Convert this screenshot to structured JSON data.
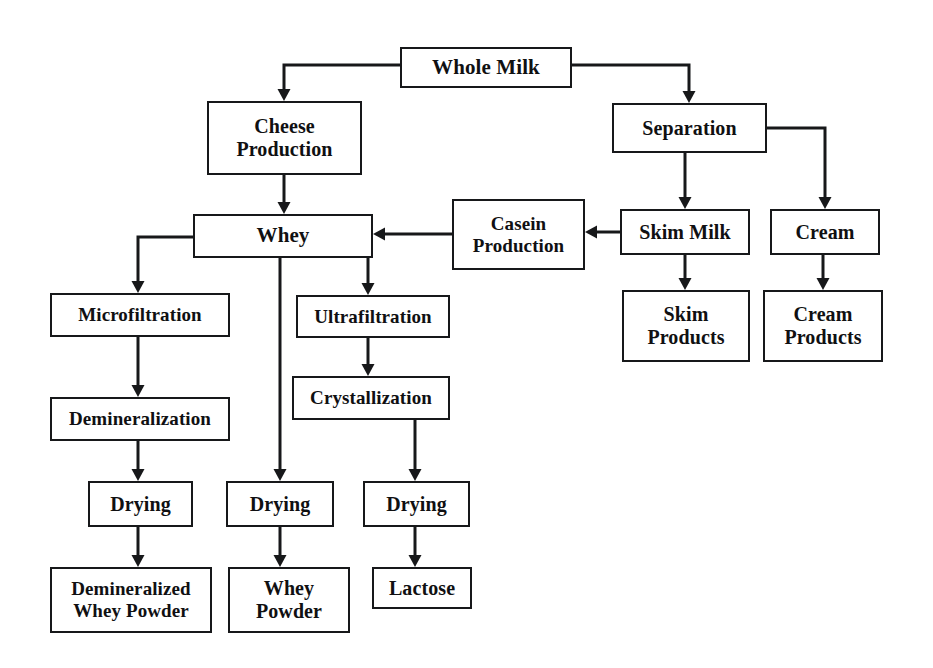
{
  "diagram": {
    "background_color": "#ffffff",
    "line_color": "#17181a",
    "text_color": "#101012",
    "nodes": [
      {
        "id": "whole_milk",
        "label": "Whole Milk",
        "x": 400,
        "y": 47,
        "w": 172,
        "h": 41,
        "font_size": 21
      },
      {
        "id": "cheese_production",
        "label": "Cheese\nProduction",
        "x": 207,
        "y": 101,
        "w": 155,
        "h": 74,
        "font_size": 20
      },
      {
        "id": "separation",
        "label": "Separation",
        "x": 612,
        "y": 103,
        "w": 155,
        "h": 50,
        "font_size": 20
      },
      {
        "id": "whey",
        "label": "Whey",
        "x": 193,
        "y": 214,
        "w": 180,
        "h": 44,
        "font_size": 21
      },
      {
        "id": "casein_production",
        "label": "Casein\nProduction",
        "x": 452,
        "y": 199,
        "w": 133,
        "h": 71,
        "font_size": 19
      },
      {
        "id": "skim_milk",
        "label": "Skim Milk",
        "x": 620,
        "y": 209,
        "w": 130,
        "h": 46,
        "font_size": 20
      },
      {
        "id": "cream",
        "label": "Cream",
        "x": 770,
        "y": 209,
        "w": 110,
        "h": 46,
        "font_size": 20
      },
      {
        "id": "skim_products",
        "label": "Skim\nProducts",
        "x": 622,
        "y": 290,
        "w": 128,
        "h": 72,
        "font_size": 20
      },
      {
        "id": "cream_products",
        "label": "Cream\nProducts",
        "x": 763,
        "y": 290,
        "w": 120,
        "h": 72,
        "font_size": 20
      },
      {
        "id": "microfiltration",
        "label": "Microfiltration",
        "x": 50,
        "y": 293,
        "w": 180,
        "h": 44,
        "font_size": 19
      },
      {
        "id": "ultrafiltration",
        "label": "Ultrafiltration",
        "x": 296,
        "y": 295,
        "w": 154,
        "h": 43,
        "font_size": 19
      },
      {
        "id": "demineralization",
        "label": "Demineralization",
        "x": 50,
        "y": 397,
        "w": 180,
        "h": 44,
        "font_size": 19
      },
      {
        "id": "crystallization",
        "label": "Crystallization",
        "x": 292,
        "y": 376,
        "w": 158,
        "h": 44,
        "font_size": 19
      },
      {
        "id": "drying_left",
        "label": "Drying",
        "x": 88,
        "y": 481,
        "w": 105,
        "h": 46,
        "font_size": 20
      },
      {
        "id": "drying_middle",
        "label": "Drying",
        "x": 226,
        "y": 481,
        "w": 108,
        "h": 46,
        "font_size": 20
      },
      {
        "id": "drying_right",
        "label": "Drying",
        "x": 363,
        "y": 481,
        "w": 107,
        "h": 46,
        "font_size": 20
      },
      {
        "id": "demineralized_powder",
        "label": "Demineralized\nWhey Powder",
        "x": 50,
        "y": 567,
        "w": 162,
        "h": 66,
        "font_size": 19
      },
      {
        "id": "whey_powder",
        "label": "Whey\nPowder",
        "x": 228,
        "y": 567,
        "w": 122,
        "h": 66,
        "font_size": 20
      },
      {
        "id": "lactose",
        "label": "Lactose",
        "x": 372,
        "y": 567,
        "w": 100,
        "h": 42,
        "font_size": 20
      }
    ],
    "edges": [
      {
        "id": "whole_milk-to-cheese_production",
        "from": "whole_milk",
        "to": "cheese_production",
        "points": "400,65 284,65 284,101",
        "arrow": "down"
      },
      {
        "id": "whole_milk-to-separation",
        "from": "whole_milk",
        "to": "separation",
        "points": "572,65 689,65 689,103",
        "arrow": "down"
      },
      {
        "id": "cheese_production-to-whey",
        "from": "cheese_production",
        "to": "whey",
        "points": "284,175 284,214",
        "arrow": "down"
      },
      {
        "id": "separation-to-skim_milk",
        "from": "separation",
        "to": "skim_milk",
        "points": "685,153 685,209",
        "arrow": "down"
      },
      {
        "id": "separation-to-cream",
        "from": "separation",
        "to": "cream",
        "points": "767,128 825,128 825,209",
        "arrow": "down"
      },
      {
        "id": "skim_milk-to-casein_production",
        "from": "skim_milk",
        "to": "casein_production",
        "points": "620,232 585,232",
        "arrow": "left"
      },
      {
        "id": "casein_production-to-whey",
        "from": "casein_production",
        "to": "whey",
        "points": "452,234 373,234",
        "arrow": "left"
      },
      {
        "id": "skim_milk-to-skim_products",
        "from": "skim_milk",
        "to": "skim_products",
        "points": "685,255 685,290",
        "arrow": "down"
      },
      {
        "id": "cream-to-cream_products",
        "from": "cream",
        "to": "cream_products",
        "points": "823,255 823,290",
        "arrow": "down"
      },
      {
        "id": "whey-to-microfiltration",
        "from": "whey",
        "to": "microfiltration",
        "points": "193,237 138,237 138,293",
        "arrow": "down"
      },
      {
        "id": "whey-to-drying_middle",
        "from": "whey",
        "to": "drying_middle",
        "points": "280,258 280,481",
        "arrow": "down"
      },
      {
        "id": "whey-to-ultrafiltration",
        "from": "whey",
        "to": "ultrafiltration",
        "points": "368,258 368,295",
        "arrow": "down"
      },
      {
        "id": "microfiltration-to-demineralization",
        "from": "microfiltration",
        "to": "demineralization",
        "points": "138,337 138,397",
        "arrow": "down"
      },
      {
        "id": "demineralization-to-drying_left",
        "from": "demineralization",
        "to": "drying_left",
        "points": "138,441 138,481",
        "arrow": "down"
      },
      {
        "id": "ultrafiltration-to-crystallization",
        "from": "ultrafiltration",
        "to": "crystallization",
        "points": "368,338 368,376",
        "arrow": "down"
      },
      {
        "id": "crystallization-to-drying_right",
        "from": "crystallization",
        "to": "drying_right",
        "points": "415,420 415,481",
        "arrow": "down"
      },
      {
        "id": "drying_left-to-demineralized_powder",
        "from": "drying_left",
        "to": "demineralized_powder",
        "points": "138,527 138,567",
        "arrow": "down"
      },
      {
        "id": "drying_middle-to-whey_powder",
        "from": "drying_middle",
        "to": "whey_powder",
        "points": "280,527 280,567",
        "arrow": "down"
      },
      {
        "id": "drying_right-to-lactose",
        "from": "drying_right",
        "to": "lactose",
        "points": "415,527 415,567",
        "arrow": "down"
      }
    ]
  }
}
